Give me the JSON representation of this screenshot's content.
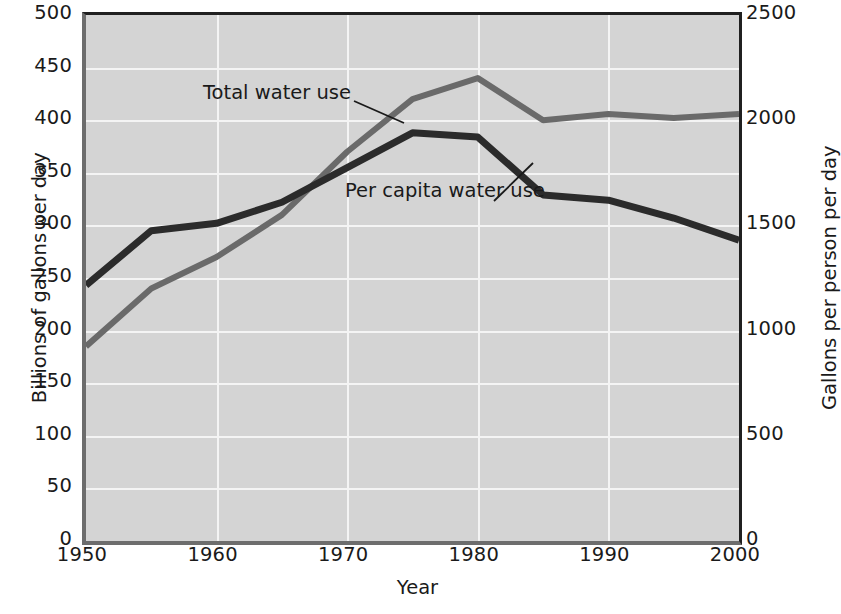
{
  "chart_data": {
    "type": "line",
    "title": "",
    "xlabel": "Year",
    "ylabel": "Billions of gallons per day",
    "ylabel_right": "Gallons per person per day",
    "grid": true,
    "legend_position": "inline-annotations",
    "x": [
      1950,
      1955,
      1960,
      1965,
      1970,
      1975,
      1980,
      1985,
      1990,
      1995,
      2000
    ],
    "xlim": [
      1950,
      2000
    ],
    "xticks": [
      1950,
      1960,
      1970,
      1980,
      1990,
      2000
    ],
    "xticklabels": [
      "1950",
      "1960",
      "1970",
      "1980",
      "1990",
      "2000"
    ],
    "ylim": [
      0,
      500
    ],
    "yticks": [
      0,
      50,
      100,
      150,
      200,
      250,
      300,
      350,
      400,
      450,
      500
    ],
    "yticklabels": [
      "0",
      "50",
      "100",
      "150",
      "200",
      "250",
      "300",
      "350",
      "400",
      "450",
      "500"
    ],
    "ylim_right": [
      0,
      2500
    ],
    "yticks_right": [
      0,
      500,
      1000,
      1500,
      2000,
      2500
    ],
    "yticklabels_right": [
      "0",
      "500",
      "1000",
      "1500",
      "2000",
      "2500"
    ],
    "series": [
      {
        "name": "Total water use",
        "axis": "left",
        "unit": "billions of gallons per day",
        "color": "#6a6a6a",
        "values": [
          185,
          240,
          270,
          310,
          370,
          420,
          440,
          400,
          406,
          402,
          406
        ]
      },
      {
        "name": "Per capita water use",
        "axis": "right",
        "unit": "gallons per person per day",
        "color": "#2b2b2b",
        "values_left_scale": [
          243,
          295,
          302,
          322,
          355,
          388,
          384,
          329,
          324,
          307,
          286
        ],
        "values": [
          1215,
          1475,
          1510,
          1610,
          1775,
          1940,
          1920,
          1645,
          1620,
          1535,
          1430
        ]
      }
    ],
    "annotations": [
      {
        "text": "Total water use",
        "series": "Total water use"
      },
      {
        "text": "Per capita water use",
        "series": "Per capita water use"
      }
    ],
    "colors": {
      "plot_background": "#d4d4d4",
      "gridlines": "#f4f4f4",
      "total_water_use": "#6a6a6a",
      "per_capita_water_use": "#2b2b2b",
      "axis_frame": "#202020"
    }
  }
}
